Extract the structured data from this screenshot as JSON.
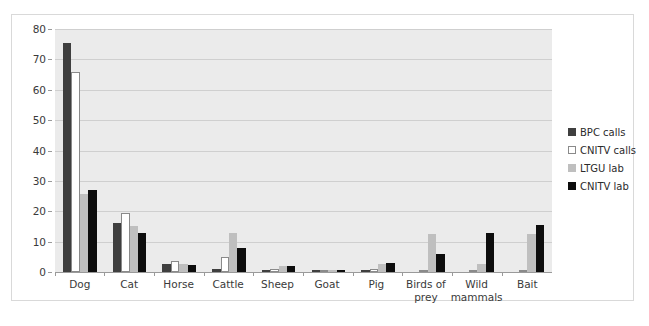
{
  "chart_data": {
    "type": "bar",
    "title": "",
    "xlabel": "",
    "ylabel": "",
    "ylim": [
      0,
      80
    ],
    "ytick_step": 10,
    "yticks": [
      0,
      10,
      20,
      30,
      40,
      50,
      60,
      70,
      80
    ],
    "grid": true,
    "legend_position": "right",
    "categories": [
      "Dog",
      "Cat",
      "Horse",
      "Cattle",
      "Sheep",
      "Goat",
      "Pig",
      "Birds of prey",
      "Wild mammals",
      "Bait"
    ],
    "series": [
      {
        "name": "BPC calls",
        "color": "#3f3f3f",
        "values": [
          75.5,
          16,
          2.5,
          1,
          0.5,
          0.7,
          0.5,
          0,
          0,
          0
        ]
      },
      {
        "name": "CNITV calls",
        "color": "#ffffff",
        "values": [
          66,
          19.5,
          3.5,
          5,
          1,
          0.8,
          1,
          0,
          0,
          0
        ]
      },
      {
        "name": "LTGU lab",
        "color": "#bfbfbf",
        "values": [
          25.8,
          15,
          2.7,
          13,
          2,
          0.8,
          2.5,
          12.5,
          2.5,
          12.5
        ]
      },
      {
        "name": "CNITV lab",
        "color": "#0d0d0d",
        "values": [
          27,
          13,
          2.2,
          8,
          2,
          0.8,
          3,
          6,
          13,
          15.5
        ]
      }
    ]
  },
  "legend": {
    "items": [
      {
        "label": "BPC calls",
        "swatch": "dark-gray-swatch"
      },
      {
        "label": "CNITV calls",
        "swatch": "white-swatch"
      },
      {
        "label": "LTGU lab",
        "swatch": "light-gray-swatch"
      },
      {
        "label": "CNITV lab",
        "swatch": "black-swatch"
      }
    ]
  }
}
